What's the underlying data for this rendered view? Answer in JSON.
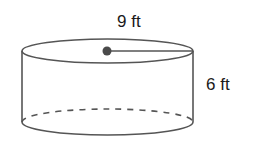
{
  "figure": {
    "shape": "cylinder",
    "radius_label": "9 ft",
    "height_label": "6 ft",
    "stroke_color": "#555555",
    "dot_color": "#4a4a4a"
  }
}
